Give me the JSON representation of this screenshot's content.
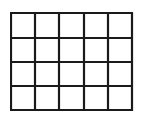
{
  "diagram": {
    "type": "grid",
    "columns": 5,
    "rows": 4,
    "line_color": "#1a1a1a",
    "background": "#ffffff",
    "x_lines": [
      1,
      25,
      49,
      74,
      98,
      122
    ],
    "y_lines": [
      1,
      26,
      50,
      74,
      98
    ],
    "width": 124,
    "height": 100,
    "stroke_width": 2.2
  }
}
